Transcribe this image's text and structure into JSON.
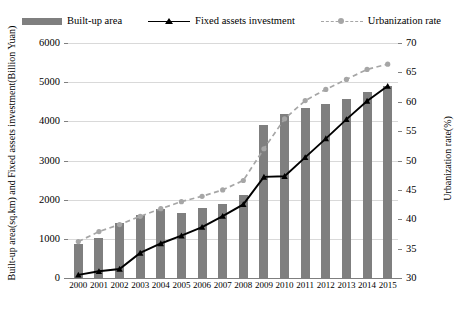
{
  "legend": {
    "items": [
      {
        "label": "Built-up area",
        "marker": "bar-swatch-icon",
        "color": "#7f7f7f"
      },
      {
        "label": "Fixed assets investment",
        "marker": "line-triangle-marker-icon",
        "color": "#000000"
      },
      {
        "label": "Urbanization rate",
        "marker": "dashed-line-circle-marker-icon",
        "color": "#a6a6a6"
      }
    ]
  },
  "axes": {
    "left_title": "Built-up area(sq.km) and Fixed assets investment(Billion Yuan)",
    "right_title": "Urbanization rate(%)",
    "left_ticks": [
      "0",
      "1000",
      "2000",
      "3000",
      "4000",
      "5000",
      "6000"
    ],
    "right_ticks": [
      "30",
      "35",
      "40",
      "45",
      "50",
      "55",
      "60",
      "65",
      "70"
    ],
    "x_ticks": [
      "2000",
      "2001",
      "2002",
      "2003",
      "2004",
      "2005",
      "2006",
      "2007",
      "2008",
      "2009",
      "2010",
      "2011",
      "2012",
      "2013",
      "2014",
      "2015"
    ]
  },
  "chart_data": {
    "type": "bar",
    "title": "",
    "xlabel": "",
    "ylabel": "Built-up area(sq.km) and Fixed assets investment(Billion Yuan)",
    "y2label": "Urbanization rate(%)",
    "grid": true,
    "legend_position": "top",
    "ylim": [
      0,
      6000
    ],
    "y2lim": [
      30,
      70
    ],
    "categories": [
      "2000",
      "2001",
      "2002",
      "2003",
      "2004",
      "2005",
      "2006",
      "2007",
      "2008",
      "2009",
      "2010",
      "2011",
      "2012",
      "2013",
      "2014",
      "2015"
    ],
    "series": [
      {
        "name": "Built-up area",
        "type": "bar",
        "axis": "left",
        "unit": "sq.km",
        "color": "#7f7f7f",
        "values": [
          870,
          1010,
          1400,
          1600,
          1750,
          1660,
          1800,
          1900,
          2120,
          3900,
          4200,
          4350,
          4450,
          4580,
          4750,
          4900
        ]
      },
      {
        "name": "Fixed assets investment",
        "type": "line",
        "axis": "left",
        "unit": "Billion Yuan",
        "color": "#000000",
        "marker": "triangle",
        "values": [
          80,
          170,
          230,
          640,
          880,
          1080,
          1300,
          1580,
          1880,
          2580,
          2600,
          3080,
          3560,
          4050,
          4520,
          4900
        ]
      },
      {
        "name": "Urbanization rate",
        "type": "line",
        "axis": "right",
        "unit": "%",
        "color": "#a6a6a6",
        "linestyle": "dashed",
        "marker": "circle",
        "values": [
          36.2,
          37.9,
          39.1,
          40.5,
          41.8,
          43.0,
          43.9,
          45.0,
          46.6,
          52.0,
          57.1,
          60.2,
          62.1,
          63.8,
          65.5,
          66.4
        ]
      }
    ]
  }
}
